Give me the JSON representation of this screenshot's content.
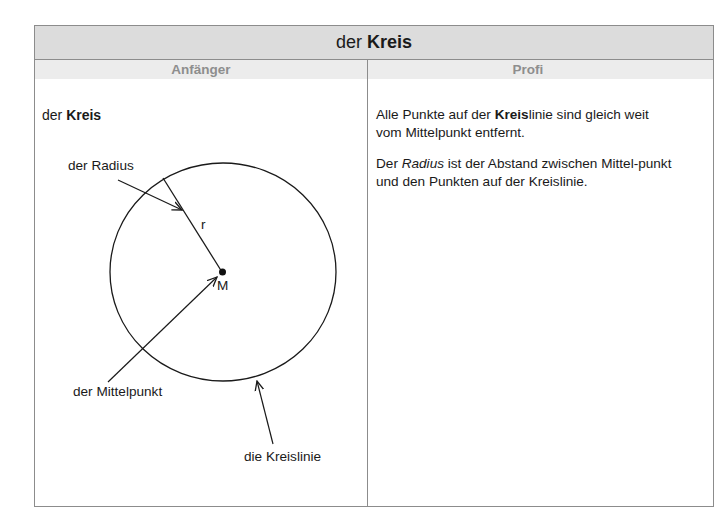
{
  "title": {
    "prefix": "der ",
    "bold": "Kreis"
  },
  "columns": {
    "left": {
      "header": "Anfänger"
    },
    "right": {
      "header": "Profi"
    }
  },
  "left": {
    "heading": {
      "prefix": "der ",
      "bold": "Kreis"
    },
    "diagram": {
      "labels": {
        "radius": "der Radius",
        "r": "r",
        "center": "M",
        "midpoint": "der Mittelpunkt",
        "circumference": "die Kreislinie"
      }
    }
  },
  "right": {
    "paragraph1": {
      "part1": "Alle Punkte auf der ",
      "bold": "Kreis",
      "part2": "linie sind gleich weit vom Mittelpunkt entfernt."
    },
    "paragraph2": {
      "part1": "Der ",
      "italic": "Radius",
      "part2": " ist der Abstand zwischen Mittel-punkt und den Punkten auf der Kreislinie."
    }
  }
}
